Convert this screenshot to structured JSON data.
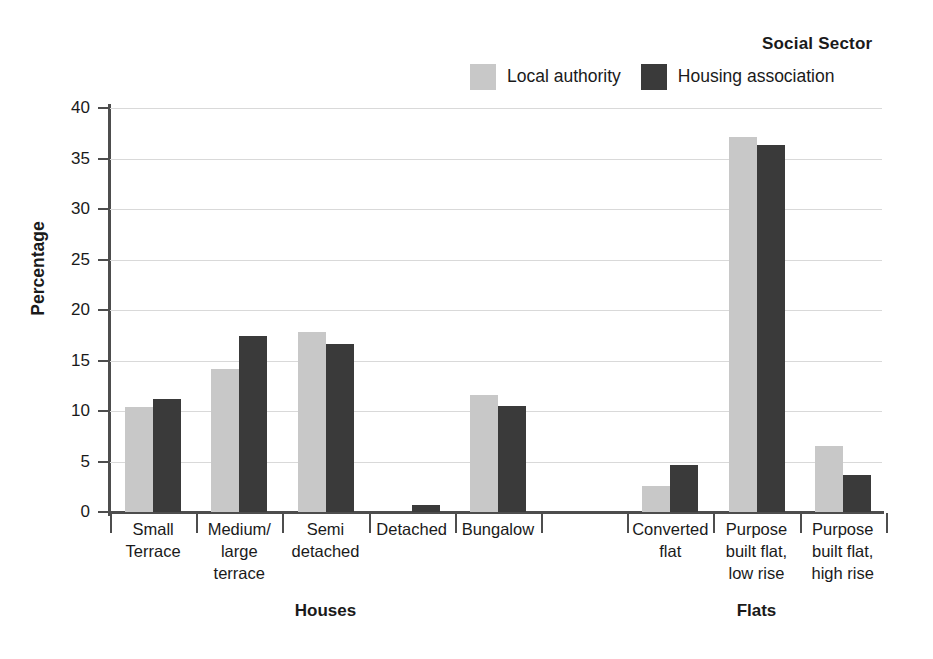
{
  "legend": {
    "title": "Social Sector",
    "entries": [
      {
        "label": "Local authority",
        "color": "#c8c8c8"
      },
      {
        "label": "Housing association",
        "color": "#3a3a3a"
      }
    ]
  },
  "axes": {
    "ylabel": "Percentage",
    "yticks": [
      "0",
      "5",
      "10",
      "15",
      "20",
      "25",
      "30",
      "35",
      "40"
    ]
  },
  "groups": [
    {
      "name": "Houses",
      "label": "Houses"
    },
    {
      "name": "Flats",
      "label": "Flats"
    }
  ],
  "chart_data": {
    "type": "bar",
    "title": "Social Sector",
    "xlabel": "",
    "ylabel": "Percentage",
    "ylim": [
      0,
      40
    ],
    "ytick_step": 5,
    "grid": true,
    "legend_position": "top",
    "categories": [
      "Small Terrace",
      "Medium/ large terrace",
      "Semi detached",
      "Detached",
      "Bungalow",
      "Converted flat",
      "Purpose built flat, low rise",
      "Purpose built flat, high rise"
    ],
    "category_lines": [
      [
        "Small",
        "Terrace"
      ],
      [
        "Medium/",
        "large",
        "terrace"
      ],
      [
        "Semi",
        "detached"
      ],
      [
        "Detached"
      ],
      [
        "Bungalow"
      ],
      [
        "Converted",
        "flat"
      ],
      [
        "Purpose",
        "built flat,",
        "low rise"
      ],
      [
        "Purpose",
        "built flat,",
        "high rise"
      ]
    ],
    "category_groups": [
      "Houses",
      "Houses",
      "Houses",
      "Houses",
      "Houses",
      "Flats",
      "Flats",
      "Flats"
    ],
    "series": [
      {
        "name": "Local authority",
        "color": "#c8c8c8",
        "values": [
          10.4,
          14.2,
          17.8,
          0.0,
          11.6,
          2.6,
          37.1,
          6.5
        ]
      },
      {
        "name": "Housing association",
        "color": "#3a3a3a",
        "values": [
          11.2,
          17.4,
          16.6,
          0.7,
          10.5,
          4.7,
          36.3,
          3.7
        ]
      }
    ]
  }
}
